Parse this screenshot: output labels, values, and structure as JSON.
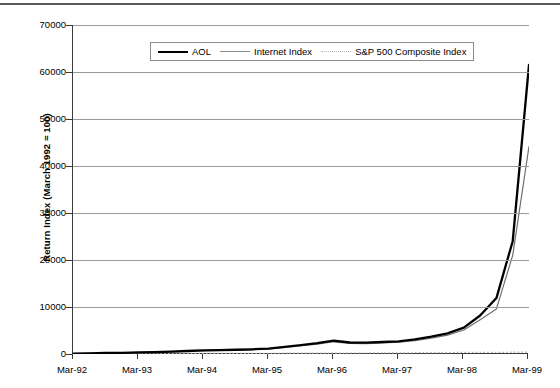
{
  "chart_data": {
    "type": "line",
    "title": "",
    "xlabel": "",
    "ylabel": "Return Index (March 1992 = 100)",
    "ylim": [
      0,
      70000
    ],
    "yticks": [
      0,
      10000,
      20000,
      30000,
      40000,
      50000,
      60000,
      70000
    ],
    "ytick_labels": [
      "0",
      "10000",
      "20000",
      "30000",
      "40000",
      "50000",
      "60000",
      "70000"
    ],
    "xticks": [
      "Mar-92",
      "Mar-93",
      "Mar-94",
      "Mar-95",
      "Mar-96",
      "Mar-97",
      "Mar-98",
      "Mar-99"
    ],
    "x_range": [
      "Mar-92",
      "Mar-99"
    ],
    "grid": "horizontal",
    "legend_position": "top-center",
    "legend": [
      "AOL",
      "Internet Index",
      "S&P 500 Composite Index"
    ],
    "x": [
      "Mar-92",
      "Jun-92",
      "Sep-92",
      "Dec-92",
      "Mar-93",
      "Jun-93",
      "Sep-93",
      "Dec-93",
      "Mar-94",
      "Jun-94",
      "Sep-94",
      "Dec-94",
      "Mar-95",
      "Jun-95",
      "Sep-95",
      "Dec-95",
      "Mar-96",
      "Jun-96",
      "Sep-96",
      "Dec-96",
      "Mar-97",
      "Jun-97",
      "Sep-97",
      "Dec-97",
      "Mar-98",
      "Jun-98",
      "Sep-98",
      "Dec-98",
      "Mar-99"
    ],
    "series": [
      {
        "name": "AOL",
        "color": "#000000",
        "style": "solid-thick",
        "values": [
          100,
          150,
          210,
          260,
          330,
          400,
          520,
          640,
          760,
          820,
          900,
          1000,
          1150,
          1500,
          1900,
          2300,
          2850,
          2450,
          2400,
          2550,
          2700,
          3100,
          3700,
          4400,
          5600,
          8200,
          11900,
          24000,
          61500
        ]
      },
      {
        "name": "Internet Index",
        "color": "#6e6e6e",
        "style": "solid-thin",
        "values": [
          100,
          140,
          190,
          240,
          300,
          360,
          470,
          580,
          690,
          750,
          830,
          930,
          1060,
          1380,
          1750,
          2120,
          2600,
          2250,
          2200,
          2350,
          2500,
          2850,
          3350,
          4000,
          5100,
          7300,
          9600,
          21000,
          44200
        ]
      },
      {
        "name": "S&P 500 Composite Index",
        "color": "#b0b0b0",
        "style": "dotted",
        "values": [
          100,
          102,
          106,
          112,
          118,
          122,
          128,
          133,
          135,
          136,
          142,
          141,
          152,
          166,
          178,
          190,
          200,
          208,
          214,
          230,
          236,
          276,
          296,
          304,
          345,
          356,
          320,
          390,
          408
        ]
      }
    ]
  }
}
